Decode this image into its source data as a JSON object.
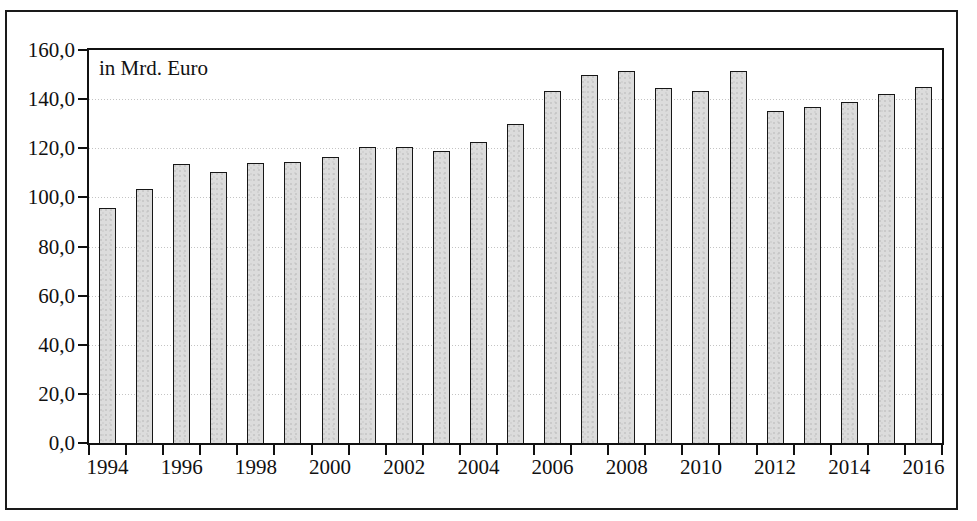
{
  "figure": {
    "unit_caption": "in Mrd. Euro"
  },
  "chart_data": {
    "type": "bar",
    "title": "",
    "subtitle": "",
    "annotations": [
      "in Mrd. Euro"
    ],
    "xlabel": "",
    "ylabel": "in Mrd. Euro",
    "grid": true,
    "legend": false,
    "ylim": [
      0,
      160
    ],
    "ytick_step": 20,
    "ytick_labels": [
      "0,0",
      "20,0",
      "40,0",
      "60,0",
      "80,0",
      "100,0",
      "120,0",
      "140,0",
      "160,0"
    ],
    "ytick_values": [
      0,
      20,
      40,
      60,
      80,
      100,
      120,
      140,
      160
    ],
    "xtick_labels": [
      "1994",
      "1996",
      "1998",
      "2000",
      "2002",
      "2004",
      "2006",
      "2008",
      "2010",
      "2012",
      "2014",
      "2016"
    ],
    "categories": [
      "1994",
      "1995",
      "1996",
      "1997",
      "1998",
      "1999",
      "2000",
      "2001",
      "2002",
      "2003",
      "2004",
      "2005",
      "2006",
      "2007",
      "2008",
      "2009",
      "2010",
      "2011",
      "2012",
      "2013",
      "2014",
      "2015",
      "2016"
    ],
    "values": [
      95.5,
      103.5,
      113.5,
      110.5,
      114.0,
      114.5,
      116.5,
      120.5,
      120.5,
      119.0,
      122.5,
      130.0,
      143.5,
      150.0,
      151.5,
      144.5,
      143.5,
      151.5,
      135.0,
      137.0,
      139.0,
      142.0,
      145.0
    ],
    "bar_color": "#dcdcdc",
    "bar_edge_color": "#171717"
  }
}
